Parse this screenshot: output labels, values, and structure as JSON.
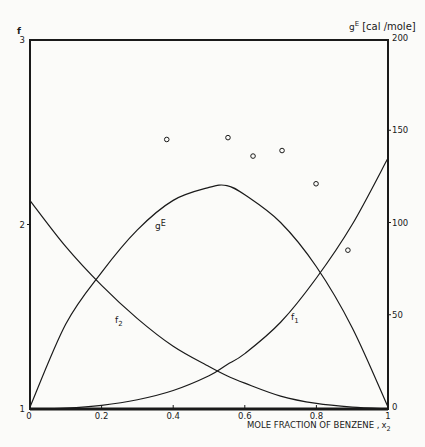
{
  "chart_data": {
    "type": "line",
    "title": "",
    "xlabel": "MOLE FRACTION OF BENZENE , x₂",
    "ylabel_left": "f",
    "ylabel_right": "gE [cal /mole]",
    "xlim": [
      0,
      1
    ],
    "ylim_left": [
      1,
      3
    ],
    "ylim_right": [
      0,
      200
    ],
    "x_ticks": [
      "0",
      "0.2",
      "0.4",
      "0.6",
      "0.8",
      "1"
    ],
    "x_tick_values": [
      0,
      0.2,
      0.4,
      0.6,
      0.8,
      1
    ],
    "y_left_ticks": [
      "1",
      "2",
      "3"
    ],
    "y_left_tick_values": [
      1,
      2,
      3
    ],
    "y_right_ticks": [
      "0",
      "50",
      "100",
      "150",
      "200"
    ],
    "y_right_tick_values": [
      0,
      50,
      100,
      150,
      200
    ],
    "grid": false,
    "legend": null,
    "x": [
      0,
      0.1,
      0.2,
      0.3,
      0.4,
      0.5,
      0.55,
      0.6,
      0.7,
      0.8,
      0.9,
      1.0
    ],
    "series": [
      {
        "name": "gE",
        "axis": "right",
        "label": "gE",
        "values": [
          0,
          45,
          73,
          96,
          112,
          119,
          120,
          115,
          100,
          76,
          43,
          0
        ]
      },
      {
        "name": "f1",
        "axis": "left",
        "label": "f₁",
        "values": [
          1.0,
          1.005,
          1.02,
          1.05,
          1.1,
          1.18,
          1.24,
          1.3,
          1.47,
          1.71,
          2.0,
          2.36
        ]
      },
      {
        "name": "f2",
        "axis": "left",
        "label": "f₂",
        "values": [
          2.13,
          1.88,
          1.67,
          1.49,
          1.34,
          1.23,
          1.18,
          1.14,
          1.07,
          1.03,
          1.01,
          1.0
        ]
      },
      {
        "name": "gE experimental",
        "axis": "right",
        "type": "scatter",
        "marker": "open-circle",
        "x": [
          0.382,
          0.553,
          0.623,
          0.704,
          0.799,
          0.888
        ],
        "values": [
          145,
          146,
          136,
          139,
          121,
          85
        ]
      }
    ],
    "annotations": [
      {
        "text": "gE",
        "x": 0.36,
        "y_right": 99
      },
      {
        "text": "f₂",
        "x": 0.25,
        "y_left": 1.48
      },
      {
        "text": "f₁",
        "x": 0.73,
        "y_left": 1.5
      }
    ]
  },
  "labels": {
    "left_axis_title": "f",
    "right_axis_title_main": "g",
    "right_axis_title_sup": "E",
    "right_axis_unit": "[cal /mole]",
    "x_axis_title": "MOLE FRACTION OF BENZENE ,",
    "x_axis_var": "x",
    "x_axis_sub": "2",
    "curve_gE_main": "g",
    "curve_gE_sup": "E",
    "curve_f1_main": "f",
    "curve_f1_sub": "1",
    "curve_f2_main": "f",
    "curve_f2_sub": "2"
  }
}
